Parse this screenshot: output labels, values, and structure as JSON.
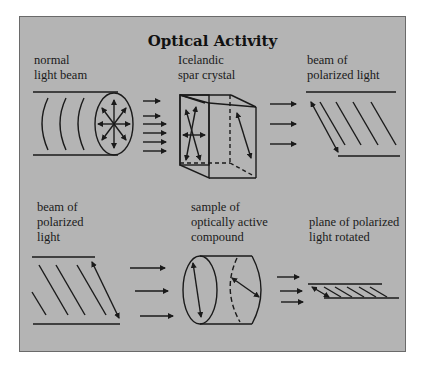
{
  "title": "Optical Activity",
  "colors": {
    "background": "#ffffff",
    "panel": "#b4b4b4",
    "border": "#6a6a6a",
    "ink": "#1a1a1a"
  },
  "labels": {
    "normal_light_beam": "normal\nlight beam",
    "icelandic_spar_crystal": "Icelandic\nspar crystal",
    "beam_polarized_top": "beam of\npolarized light",
    "beam_polarized_bottom": "beam of\npolarized\nlight",
    "sample_compound": "sample of\noptically active\ncompound",
    "plane_rotated": "plane of polarized\nlight rotated"
  }
}
